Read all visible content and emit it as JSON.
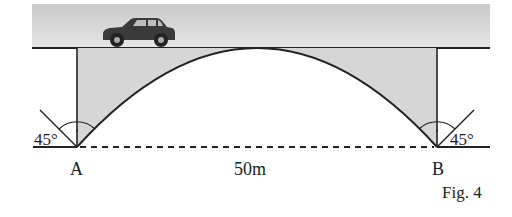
{
  "figure": {
    "caption": "Fig. 4",
    "points": {
      "A": "A",
      "B": "B"
    },
    "span_label": "50m",
    "angle_left": "45°",
    "angle_right": "45°"
  },
  "colors": {
    "road_fill": "#d9d9d9",
    "road_fill_top": "#cfcfcf",
    "spandrel_fill": "#d6d6d6",
    "line": "#222222",
    "car": "#3a3a3a"
  }
}
